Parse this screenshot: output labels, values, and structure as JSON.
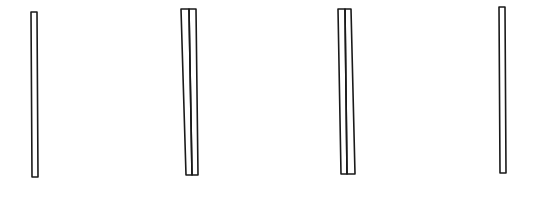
{
  "sketch": {
    "background": "#ffffff",
    "stroke_color": "#1a1a1a",
    "groups": [
      {
        "id": "stick-1",
        "sticks": [
          {
            "points": "31,12 37,12 38,177 32,177"
          }
        ]
      },
      {
        "id": "stick-pair-2",
        "sticks": [
          {
            "points": "181,9 189,9 192,175 186,175"
          },
          {
            "points": "189,9 196,9 198,175 192,175"
          }
        ]
      },
      {
        "id": "stick-pair-3",
        "sticks": [
          {
            "points": "338,9 345,9 347,174 341,174"
          },
          {
            "points": "345,9 351,9 355,174 347,174"
          }
        ]
      },
      {
        "id": "stick-4",
        "sticks": [
          {
            "points": "499,7 505,7 506,173 500,173"
          }
        ]
      }
    ]
  }
}
